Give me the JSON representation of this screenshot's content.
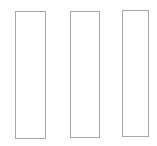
{
  "page": {
    "background_color": "#ffffff",
    "width": 157,
    "height": 146
  },
  "style": {
    "border_color": "#a8a8a8",
    "fill_color": "#ffffff",
    "border_width_px": 1
  },
  "columns": [
    {
      "name": "column-1",
      "content": "",
      "x": 15,
      "y": 11,
      "width": 31,
      "height": 128
    },
    {
      "name": "column-2",
      "content": "",
      "x": 70,
      "y": 11,
      "width": 30,
      "height": 127
    },
    {
      "name": "column-3",
      "content": "",
      "x": 122,
      "y": 10,
      "width": 27,
      "height": 127
    }
  ]
}
